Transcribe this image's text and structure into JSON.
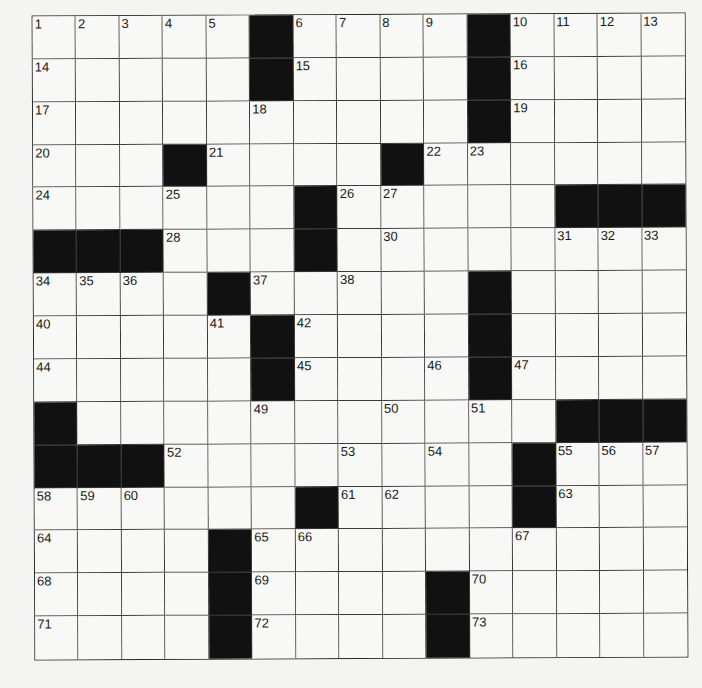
{
  "puzzle": {
    "rows": 15,
    "cols": 15,
    "colors": {
      "black_square": "#111111",
      "white_square": "#f8f8f6",
      "grid_line": "#3a3a3a"
    },
    "layout": [
      "1111101111011111",
      "placeholder"
    ],
    "grid": [
      ".....#....#....",
      ".....#....#....",
      "..........#....",
      "...#....#......",
      "......#.....###",
      "###...#........",
      "....#.....#....",
      ".....#....#....",
      ".....#....#....",
      "#...........###",
      "###........#...",
      "......#....#...",
      "....#..........",
      "....#....#.....",
      "....#....#....."
    ],
    "numbers": [
      {
        "n": "1",
        "r": 0,
        "c": 0
      },
      {
        "n": "2",
        "r": 0,
        "c": 1
      },
      {
        "n": "3",
        "r": 0,
        "c": 2
      },
      {
        "n": "4",
        "r": 0,
        "c": 3
      },
      {
        "n": "5",
        "r": 0,
        "c": 4
      },
      {
        "n": "6",
        "r": 0,
        "c": 6
      },
      {
        "n": "7",
        "r": 0,
        "c": 7
      },
      {
        "n": "8",
        "r": 0,
        "c": 8
      },
      {
        "n": "9",
        "r": 0,
        "c": 9
      },
      {
        "n": "10",
        "r": 0,
        "c": 11
      },
      {
        "n": "11",
        "r": 0,
        "c": 12
      },
      {
        "n": "12",
        "r": 0,
        "c": 13
      },
      {
        "n": "13",
        "r": 0,
        "c": 14
      },
      {
        "n": "14",
        "r": 1,
        "c": 0
      },
      {
        "n": "15",
        "r": 1,
        "c": 6
      },
      {
        "n": "16",
        "r": 1,
        "c": 11
      },
      {
        "n": "17",
        "r": 2,
        "c": 0
      },
      {
        "n": "18",
        "r": 2,
        "c": 5
      },
      {
        "n": "19",
        "r": 2,
        "c": 11
      },
      {
        "n": "20",
        "r": 3,
        "c": 0
      },
      {
        "n": "21",
        "r": 3,
        "c": 4
      },
      {
        "n": "22",
        "r": 3,
        "c": 9
      },
      {
        "n": "23",
        "r": 3,
        "c": 10
      },
      {
        "n": "24",
        "r": 4,
        "c": 0
      },
      {
        "n": "25",
        "r": 4,
        "c": 3
      },
      {
        "n": "26",
        "r": 4,
        "c": 7
      },
      {
        "n": "27",
        "r": 4,
        "c": 8
      },
      {
        "n": "28",
        "r": 5,
        "c": 3
      },
      {
        "n": "29",
        "r": 5,
        "c": 6
      },
      {
        "n": "30",
        "r": 5,
        "c": 8
      },
      {
        "n": "31",
        "r": 5,
        "c": 12
      },
      {
        "n": "32",
        "r": 5,
        "c": 13
      },
      {
        "n": "33",
        "r": 5,
        "c": 14
      },
      {
        "n": "34",
        "r": 6,
        "c": 0
      },
      {
        "n": "35",
        "r": 6,
        "c": 1
      },
      {
        "n": "36",
        "r": 6,
        "c": 2
      },
      {
        "n": "37",
        "r": 6,
        "c": 5
      },
      {
        "n": "38",
        "r": 6,
        "c": 7
      },
      {
        "n": "39",
        "r": 6,
        "c": 10
      },
      {
        "n": "40",
        "r": 7,
        "c": 0
      },
      {
        "n": "41",
        "r": 7,
        "c": 4
      },
      {
        "n": "42",
        "r": 7,
        "c": 6
      },
      {
        "n": "43",
        "r": 7,
        "c": 10
      },
      {
        "n": "44",
        "r": 8,
        "c": 0
      },
      {
        "n": "45",
        "r": 8,
        "c": 6
      },
      {
        "n": "46",
        "r": 8,
        "c": 9
      },
      {
        "n": "47",
        "r": 8,
        "c": 11
      },
      {
        "n": "48",
        "r": 9,
        "c": 0
      },
      {
        "n": "49",
        "r": 9,
        "c": 5
      },
      {
        "n": "50",
        "r": 9,
        "c": 8
      },
      {
        "n": "51",
        "r": 9,
        "c": 10
      },
      {
        "n": "52",
        "r": 10,
        "c": 3
      },
      {
        "n": "53",
        "r": 10,
        "c": 7
      },
      {
        "n": "54",
        "r": 10,
        "c": 9
      },
      {
        "n": "55",
        "r": 10,
        "c": 12
      },
      {
        "n": "56",
        "r": 10,
        "c": 13
      },
      {
        "n": "57",
        "r": 10,
        "c": 14
      },
      {
        "n": "58",
        "r": 11,
        "c": 0
      },
      {
        "n": "59",
        "r": 11,
        "c": 1
      },
      {
        "n": "60",
        "r": 11,
        "c": 2
      },
      {
        "n": "61",
        "r": 11,
        "c": 7
      },
      {
        "n": "62",
        "r": 11,
        "c": 8
      },
      {
        "n": "63",
        "r": 11,
        "c": 12
      },
      {
        "n": "64",
        "r": 12,
        "c": 0
      },
      {
        "n": "65",
        "r": 12,
        "c": 5
      },
      {
        "n": "66",
        "r": 12,
        "c": 6
      },
      {
        "n": "67",
        "r": 12,
        "c": 11
      },
      {
        "n": "68",
        "r": 13,
        "c": 0
      },
      {
        "n": "69",
        "r": 13,
        "c": 5
      },
      {
        "n": "70",
        "r": 13,
        "c": 10
      },
      {
        "n": "71",
        "r": 14,
        "c": 0
      },
      {
        "n": "72",
        "r": 14,
        "c": 5
      },
      {
        "n": "73",
        "r": 14,
        "c": 10
      }
    ]
  }
}
